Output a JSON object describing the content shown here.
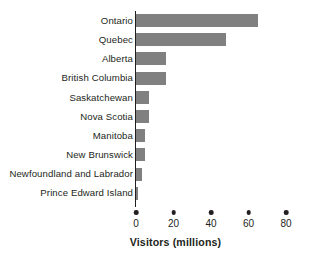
{
  "chart_data": {
    "type": "bar",
    "orientation": "horizontal",
    "title": "",
    "subtitle": "",
    "xlabel": "Visitors (millions)",
    "ylabel": "",
    "categories": [
      "Ontario",
      "Quebec",
      "Alberta",
      "British Columbia",
      "Saskatchewan",
      "Nova Scotia",
      "Manitoba",
      "New Brunswick",
      "Newfoundland and Labrador",
      "Prince Edward Island"
    ],
    "values": [
      65,
      48,
      16,
      16,
      7,
      7,
      5,
      5,
      3,
      1
    ],
    "xlim": [
      0,
      80
    ],
    "xticks": [
      0,
      20,
      40,
      60,
      80
    ],
    "xtick_labels": [
      "0",
      "20",
      "40",
      "60",
      "80"
    ],
    "grid": false,
    "legend": false,
    "bar_color": "#808080",
    "axis_color": "#231f20",
    "text_color": "#231f20",
    "background_color": "#ffffff"
  }
}
